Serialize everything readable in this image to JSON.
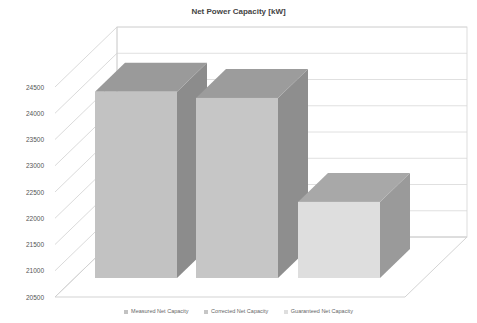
{
  "chart_data": {
    "type": "bar",
    "style": "3d-column",
    "title": "Net Power Capacity [kW]",
    "xlabel": "",
    "ylabel": "",
    "categories": [
      "Measured Net Capacity",
      "Corrected Net Capacity",
      "Guaranteed Net Capacity"
    ],
    "values": [
      24050,
      23930,
      21950
    ],
    "ylim": [
      20500,
      24500
    ],
    "yticks": [
      20500,
      21000,
      21500,
      22000,
      22500,
      23000,
      23500,
      24000,
      24500
    ],
    "grid": true,
    "legend_position": "bottom",
    "colors": {
      "Measured Net Capacity": {
        "front": "#c2c2c2",
        "side": "#8c8c8c",
        "top": "#9a9a9a"
      },
      "Corrected Net Capacity": {
        "front": "#c6c6c6",
        "side": "#8e8e8e",
        "top": "#9c9c9c"
      },
      "Guaranteed Net Capacity": {
        "front": "#dedede",
        "side": "#9a9a9a",
        "top": "#a8a8a8"
      }
    }
  },
  "legend": [
    {
      "label": "Measured Net Capacity",
      "color": "#c2c2c2"
    },
    {
      "label": "Corrected Net Capacity",
      "color": "#c6c6c6"
    },
    {
      "label": "Guaranteed Net Capacity",
      "color": "#dedede"
    }
  ]
}
